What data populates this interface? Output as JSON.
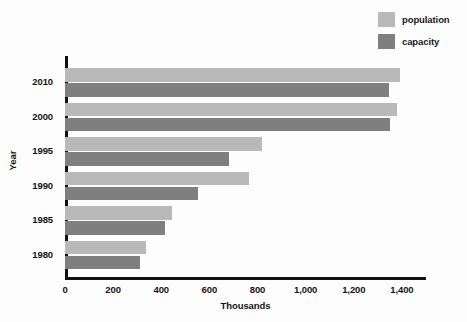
{
  "chart_data": {
    "type": "bar",
    "orientation": "horizontal",
    "title": "",
    "xlabel": "Thousands",
    "ylabel": "Year",
    "categories": [
      "2010",
      "2000",
      "1995",
      "1990",
      "1985",
      "1980"
    ],
    "series": [
      {
        "name": "population",
        "color": "#b9b9b9",
        "values": [
          1390,
          1380,
          817,
          763,
          446,
          337
        ]
      },
      {
        "name": "capacity",
        "color": "#7f7f7f",
        "values": [
          1345,
          1350,
          683,
          554,
          417,
          313
        ]
      }
    ],
    "xlim": [
      0,
      1500
    ],
    "xticks": [
      0,
      200,
      400,
      600,
      800,
      1000,
      1200,
      1400
    ],
    "xticklabels": [
      "0",
      "200",
      "400",
      "600",
      "800",
      "1,000",
      "1,200",
      "1,400"
    ],
    "grid": false,
    "legend_position": "top-right",
    "axis_color": "#111111",
    "background_color": "#fdfdfd"
  },
  "legend": {
    "entries": [
      {
        "label": "population",
        "color": "#b9b9b9"
      },
      {
        "label": "capacity",
        "color": "#7f7f7f"
      }
    ]
  },
  "axes": {
    "y_title": "Year",
    "x_title": "Thousands"
  }
}
